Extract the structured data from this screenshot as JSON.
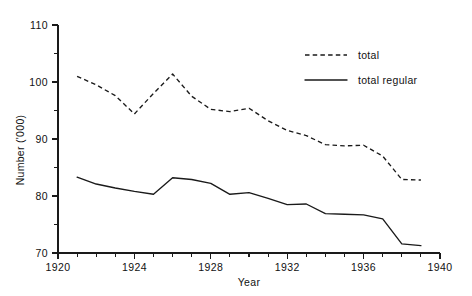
{
  "chart_data": {
    "type": "line",
    "title": "",
    "xlabel": "Year",
    "ylabel": "Number ('000)",
    "xlim": [
      1920,
      1940
    ],
    "ylim": [
      70,
      110
    ],
    "grid": false,
    "legend_position": "top-right",
    "x_major_ticks": [
      1920,
      1924,
      1928,
      1932,
      1936,
      1940
    ],
    "x_major_tick_labels": [
      "1920",
      "1924",
      "1928",
      "1932",
      "1936",
      "1940"
    ],
    "x_minor_tick_step": 1,
    "y_major_ticks": [
      70,
      80,
      90,
      100,
      110
    ],
    "y_major_tick_labels": [
      "70",
      "80",
      "90",
      "100",
      "110"
    ],
    "y_minor_ticks": [
      75,
      85,
      95,
      105
    ],
    "x": [
      1921,
      1922,
      1923,
      1924,
      1925,
      1926,
      1927,
      1928,
      1929,
      1930,
      1931,
      1932,
      1933,
      1934,
      1935,
      1936,
      1937,
      1938,
      1939
    ],
    "series": [
      {
        "name": "total",
        "style": "dashed",
        "color": "#1a1a1a",
        "values": [
          101.0,
          99.5,
          97.6,
          94.4,
          98.0,
          101.4,
          97.5,
          95.2,
          94.8,
          95.4,
          93.2,
          91.5,
          90.6,
          89.0,
          88.8,
          88.9,
          87.0,
          82.9,
          82.8
        ]
      },
      {
        "name": "total regular",
        "style": "solid",
        "color": "#1a1a1a",
        "values": [
          83.3,
          82.1,
          81.4,
          80.8,
          80.3,
          83.2,
          82.9,
          82.2,
          80.3,
          80.6,
          79.6,
          78.5,
          78.6,
          76.9,
          76.8,
          76.7,
          76.0,
          71.6,
          71.3
        ]
      }
    ]
  },
  "legend": {
    "items": [
      {
        "label": "total",
        "style": "dashed"
      },
      {
        "label": "total regular",
        "style": "solid"
      }
    ]
  },
  "axes": {
    "y_axis_title": "Number ('000)",
    "x_axis_title": "Year"
  }
}
